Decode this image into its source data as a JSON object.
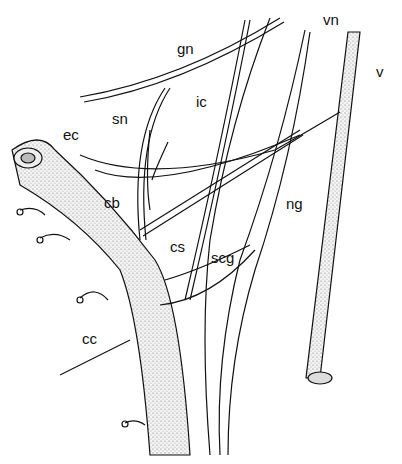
{
  "figure": {
    "type": "anatomical line illustration",
    "labels": [
      {
        "id": "gn",
        "text": "gn",
        "x": 177,
        "y": 41
      },
      {
        "id": "vn",
        "text": "vn",
        "x": 323,
        "y": 12
      },
      {
        "id": "v",
        "text": "v",
        "x": 376,
        "y": 64
      },
      {
        "id": "ic",
        "text": "ic",
        "x": 196,
        "y": 94
      },
      {
        "id": "sn",
        "text": "sn",
        "x": 112,
        "y": 111
      },
      {
        "id": "ec",
        "text": "ec",
        "x": 63,
        "y": 127
      },
      {
        "id": "cb",
        "text": "cb",
        "x": 104,
        "y": 195
      },
      {
        "id": "ng",
        "text": "ng",
        "x": 286,
        "y": 196
      },
      {
        "id": "cs",
        "text": "cs",
        "x": 170,
        "y": 239
      },
      {
        "id": "scg",
        "text": "scg",
        "x": 211,
        "y": 250
      },
      {
        "id": "cc",
        "text": "cc",
        "x": 82,
        "y": 331
      }
    ]
  }
}
